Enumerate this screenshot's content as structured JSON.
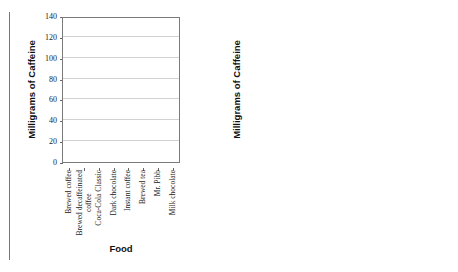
{
  "chart_data": [
    {
      "type": "bar",
      "title": "",
      "panel": "left-blank-template",
      "categories": [
        "Brewed coffee",
        "Brewed decaffeinated coffee",
        "Coca-Cola Classic",
        "Dark chocolate",
        "Instant coffee",
        "Brewed tea",
        "Mr. Pibb",
        "Milk chocolate"
      ],
      "values": [
        0,
        0,
        0,
        0,
        0,
        0,
        0,
        0
      ],
      "xlabel": "Food",
      "ylabel": "Milligrams of Caffeine",
      "ylim": [
        0,
        140
      ],
      "yticks": [
        0,
        20,
        40,
        60,
        80,
        100,
        120,
        140
      ],
      "grid": true,
      "legend": "none"
    },
    {
      "type": "bar",
      "title": "",
      "panel": "right-filled",
      "categories": [
        "Brewed coffee",
        "Brewed decaffeinated coffee",
        "Coca-Cola Classic",
        "Dark chocolate",
        "Instant coffee",
        "Brewed tea",
        "Mr. Pibb",
        "Milk chocolate"
      ],
      "values": [
        123,
        3,
        29,
        28,
        104,
        64,
        24,
        9
      ],
      "xlabel": "Food",
      "ylabel": "Milligrams of Caffeine",
      "ylim": [
        0,
        140
      ],
      "yticks": [
        0,
        20,
        40,
        60,
        80,
        100,
        120,
        140
      ],
      "grid": true,
      "legend": "none"
    }
  ],
  "colors": {
    "bar_fill": "#dcdcdc",
    "bar_border": "#9a9a9a",
    "axis": "#7a7a7a",
    "grid": "#d2d2d2",
    "text": "#1a1a1a"
  },
  "category_label_lines": [
    [
      "Brewed coffee"
    ],
    [
      "Brewed decaffeinated",
      "coffee"
    ],
    [
      "Coca-Cola Classic"
    ],
    [
      "Dark chocolate"
    ],
    [
      "Instant coffee"
    ],
    [
      "Brewed tea"
    ],
    [
      "Mr. Pibb"
    ],
    [
      "Milk chocolate"
    ]
  ]
}
